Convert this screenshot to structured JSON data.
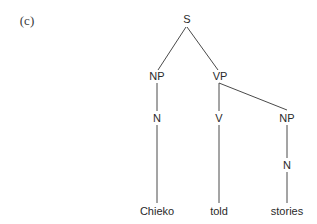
{
  "figure": {
    "panel_label": "(c)",
    "type": "syntax-tree",
    "nodes": {
      "S": "S",
      "NP_subject": "NP",
      "VP": "VP",
      "N_subject": "N",
      "V": "V",
      "NP_object": "NP",
      "N_object": "N"
    },
    "leaves": {
      "subject": "Chieko",
      "verb": "told",
      "object": "stories"
    },
    "line_color": "#4a4a4a",
    "text_color": "#2a2a2a"
  }
}
